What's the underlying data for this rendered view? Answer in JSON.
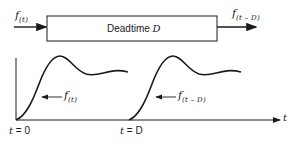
{
  "block": {
    "title_prefix": "Deadtime",
    "title_var": "D"
  },
  "input_signal": {
    "func": "f",
    "arg": "(t)"
  },
  "output_signal": {
    "func": "f",
    "arg": "(t – D)"
  },
  "plot": {
    "curve_labels": [
      {
        "func": "f",
        "arg": "(t)"
      },
      {
        "func": "f",
        "arg": "(t – D)"
      }
    ],
    "x_ticks": [
      {
        "var": "t",
        "eq": " = 0"
      },
      {
        "var": "t",
        "eq": " = D"
      }
    ],
    "x_axis_label": "t"
  }
}
